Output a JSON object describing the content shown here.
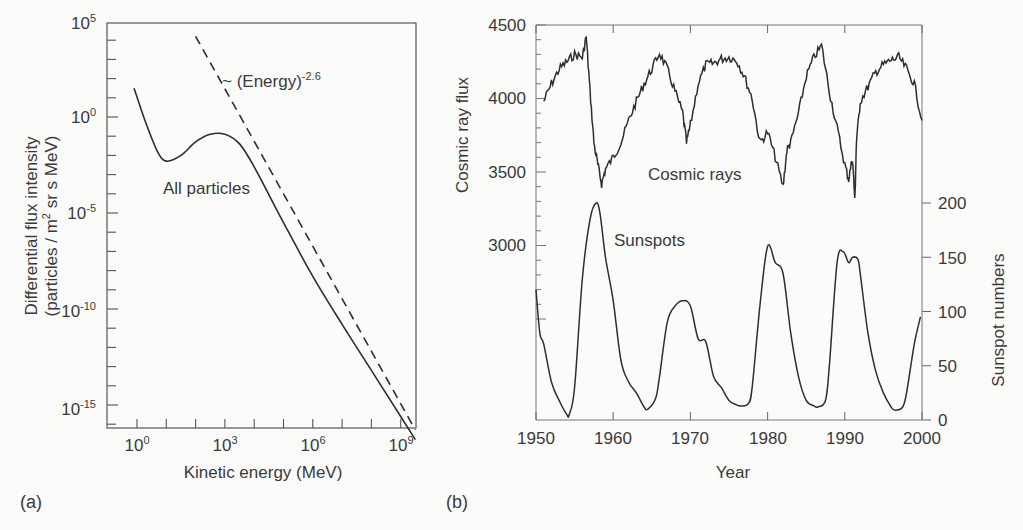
{
  "chart_data": [
    {
      "panel": "(a)",
      "type": "line",
      "title": "",
      "xlabel": "Kinetic energy (MeV)",
      "ylabel": "Differential flux intensity (particles / m² sr s MeV)",
      "xscale": "log",
      "yscale": "log",
      "xlim": [
        0.1,
        5000000000
      ],
      "ylim": [
        1e-17,
        100000.0
      ],
      "x_ticks": [
        "10^0",
        "10^3",
        "10^6",
        "10^9"
      ],
      "y_ticks": [
        "10^5",
        "10^0",
        "10^-5",
        "10^-10",
        "10^-15"
      ],
      "grid": false,
      "series": [
        {
          "name": "All particles",
          "style": "solid",
          "x_log10": [
            -0.1,
            0.3,
            0.7,
            1.0,
            1.5,
            2.0,
            2.5,
            3.0,
            3.5,
            4.0,
            5.0,
            6.0,
            7.0,
            8.0,
            9.0,
            9.5
          ],
          "y_log10": [
            1.5,
            -0.3,
            -1.8,
            -2.3,
            -2.0,
            -1.3,
            -0.9,
            -0.9,
            -1.4,
            -2.6,
            -5.5,
            -8.3,
            -10.8,
            -13.2,
            -15.6,
            -16.8
          ]
        },
        {
          "name": "~ (Energy)^-2.6",
          "style": "dashed",
          "x_log10": [
            2.0,
            9.5
          ],
          "y_log10": [
            4.2,
            -16.3
          ]
        }
      ],
      "annotations": [
        "~ (Energy)^-2.6",
        "All particles"
      ]
    },
    {
      "panel": "(b)",
      "type": "line",
      "title": "",
      "xlabel": "Year",
      "ylabel_left": "Cosmic ray flux",
      "ylabel_right": "Sunspot numbers",
      "xlim": [
        1950,
        2000
      ],
      "ylim_left": [
        2400,
        4500
      ],
      "ylim_right": [
        0,
        380
      ],
      "x_ticks": [
        1950,
        1960,
        1970,
        1980,
        1990,
        2000
      ],
      "y_ticks_left": [
        3000,
        3500,
        4000,
        4500
      ],
      "y_ticks_right": [
        0,
        50,
        100,
        150,
        200
      ],
      "grid": false,
      "series": [
        {
          "name": "Cosmic rays",
          "axis": "left",
          "x": [
            1951.0,
            1952.0,
            1953.0,
            1954.0,
            1955.0,
            1956.0,
            1956.5,
            1957.0,
            1957.5,
            1958.0,
            1958.5,
            1959.0,
            1960.0,
            1961.0,
            1962.0,
            1963.0,
            1964.0,
            1965.0,
            1966.0,
            1967.0,
            1968.0,
            1969.0,
            1969.5,
            1970.0,
            1971.0,
            1972.0,
            1973.0,
            1974.0,
            1975.0,
            1976.0,
            1977.0,
            1978.0,
            1979.0,
            1980.0,
            1981.0,
            1982.0,
            1982.5,
            1983.0,
            1984.0,
            1985.0,
            1986.0,
            1987.0,
            1988.0,
            1989.0,
            1990.0,
            1990.5,
            1991.0,
            1991.3,
            1991.5,
            1992.0,
            1993.0,
            1994.0,
            1995.0,
            1996.0,
            1997.0,
            1998.0,
            1999.0,
            2000.0
          ],
          "values": [
            3980,
            4100,
            4200,
            4250,
            4300,
            4280,
            4420,
            4050,
            3700,
            3550,
            3420,
            3520,
            3600,
            3700,
            3850,
            3980,
            4100,
            4200,
            4310,
            4200,
            4050,
            3900,
            3700,
            3820,
            4100,
            4230,
            4240,
            4270,
            4280,
            4260,
            4150,
            4000,
            3700,
            3770,
            3600,
            3400,
            3650,
            3700,
            3900,
            4150,
            4280,
            4360,
            4050,
            3800,
            3550,
            3450,
            3600,
            3300,
            3700,
            3980,
            4080,
            4180,
            4230,
            4260,
            4280,
            4200,
            4100,
            3850
          ]
        },
        {
          "name": "Sunspots",
          "axis": "right",
          "x": [
            1950.0,
            1950.5,
            1951.0,
            1952.0,
            1953.0,
            1954.0,
            1954.3,
            1955.0,
            1956.0,
            1957.0,
            1957.8,
            1958.3,
            1959.0,
            1960.0,
            1961.0,
            1962.0,
            1963.0,
            1964.0,
            1964.5,
            1965.5,
            1966.0,
            1967.0,
            1968.0,
            1969.0,
            1970.0,
            1971.0,
            1972.0,
            1973.0,
            1974.0,
            1975.0,
            1976.0,
            1976.5,
            1977.5,
            1978.0,
            1979.0,
            1980.0,
            1981.0,
            1982.0,
            1983.0,
            1984.0,
            1985.0,
            1986.0,
            1986.5,
            1987.5,
            1988.0,
            1989.0,
            1989.8,
            1990.5,
            1991.0,
            1991.7,
            1992.0,
            1993.0,
            1994.0,
            1995.0,
            1996.0,
            1996.5,
            1997.5,
            1998.0,
            1999.0,
            1999.8
          ],
          "values": [
            120,
            80,
            70,
            35,
            18,
            5,
            5,
            30,
            130,
            185,
            200,
            190,
            150,
            110,
            55,
            35,
            25,
            12,
            10,
            20,
            40,
            90,
            105,
            110,
            105,
            75,
            72,
            40,
            30,
            18,
            14,
            13,
            15,
            30,
            105,
            160,
            145,
            135,
            80,
            40,
            18,
            13,
            12,
            18,
            50,
            145,
            155,
            145,
            150,
            148,
            135,
            80,
            45,
            25,
            12,
            9,
            12,
            25,
            70,
            95
          ]
        }
      ],
      "annotations": [
        "Cosmic rays",
        "Sunspots"
      ]
    }
  ],
  "panel_a": {
    "label": "(a)",
    "xlabel": "Kinetic energy (MeV)",
    "ylabel_line1": "Differential flux intensity",
    "ylabel_line2_pre": "(particles / m",
    "ylabel_line2_sup": "2",
    "ylabel_line2_post": " sr s MeV)",
    "annot_power_base": "~ (Energy)",
    "annot_power_exp": "-2.6",
    "annot_all": "All particles",
    "xticks": [
      {
        "base": "10",
        "exp": "0"
      },
      {
        "base": "10",
        "exp": "3"
      },
      {
        "base": "10",
        "exp": "6"
      },
      {
        "base": "10",
        "exp": "9"
      }
    ],
    "yticks": [
      {
        "base": "10",
        "exp": "5"
      },
      {
        "base": "10",
        "exp": "0"
      },
      {
        "base": "10",
        "exp": "-5"
      },
      {
        "base": "10",
        "exp": "-10"
      },
      {
        "base": "10",
        "exp": "-15"
      }
    ]
  },
  "panel_b": {
    "label": "(b)",
    "xlabel": "Year",
    "ylabel_left": "Cosmic ray flux",
    "ylabel_right": "Sunspot numbers",
    "annot_cosmic": "Cosmic rays",
    "annot_sunspots": "Sunspots",
    "xticks": [
      "1950",
      "1960",
      "1970",
      "1980",
      "1990",
      "2000"
    ],
    "yticks_left": [
      "4500",
      "4000",
      "3500",
      "3000"
    ],
    "yticks_right": [
      "200",
      "150",
      "100",
      "50",
      "0"
    ]
  },
  "colors": {
    "background": "#fbfbf9",
    "line": "#2e2e2e",
    "axis": "#555555",
    "text": "#3a3a3a"
  }
}
